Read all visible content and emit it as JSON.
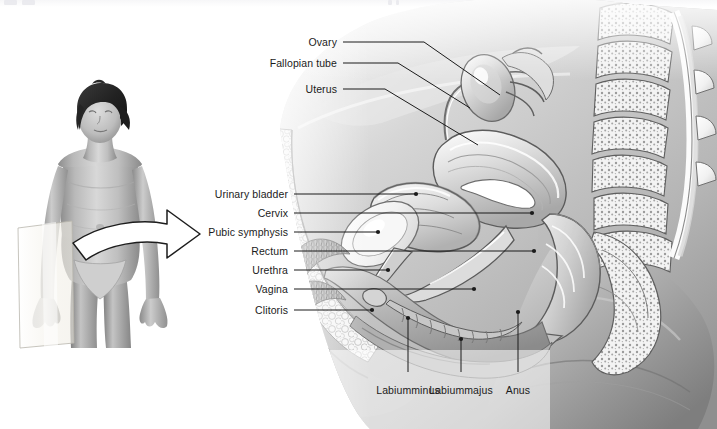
{
  "figure": {
    "orientation_photo_alt": "Standing female figure with midsagittal plane and curved arrow",
    "background_color": "#ffffff",
    "ink_color": "#1b1b1b"
  },
  "labels_left_upper": [
    {
      "id": "ovary",
      "text": "Ovary",
      "x": 337,
      "y": 42
    },
    {
      "id": "fallopian-tube",
      "text": "Fallopian tube",
      "x": 337,
      "y": 63
    },
    {
      "id": "uterus",
      "text": "Uterus",
      "x": 337,
      "y": 89
    }
  ],
  "labels_left_lower": [
    {
      "id": "urinary-bladder",
      "text": "Urinary bladder",
      "x": 288,
      "y": 194
    },
    {
      "id": "cervix",
      "text": "Cervix",
      "x": 288,
      "y": 213
    },
    {
      "id": "pubic-symphysis",
      "text": "Pubic symphysis",
      "x": 288,
      "y": 232
    },
    {
      "id": "rectum",
      "text": "Rectum",
      "x": 288,
      "y": 251
    },
    {
      "id": "urethra",
      "text": "Urethra",
      "x": 288,
      "y": 270
    },
    {
      "id": "vagina",
      "text": "Vagina",
      "x": 288,
      "y": 289
    },
    {
      "id": "clitoris",
      "text": "Clitoris",
      "x": 288,
      "y": 310
    }
  ],
  "labels_bottom": [
    {
      "id": "labium-minus",
      "line1": "Labium",
      "line2": "minus",
      "x": 408,
      "y": 390
    },
    {
      "id": "labium-majus",
      "line1": "Labium",
      "line2": "majus",
      "x": 461,
      "y": 390
    },
    {
      "id": "anus",
      "line1": "Anus",
      "line2": "",
      "x": 518,
      "y": 390
    }
  ],
  "leaders_upper": [
    {
      "id": "ovary",
      "path": "M343,42 L424,42 L500,95"
    },
    {
      "id": "fallopian-tube",
      "path": "M343,63 L398,63 L470,108"
    },
    {
      "id": "uterus",
      "path": "M343,89 L385,89 L478,145"
    }
  ],
  "leaders_lower": [
    {
      "id": "urinary-bladder",
      "path": "M294,194 L416,194",
      "dot": [
        416,
        194
      ]
    },
    {
      "id": "cervix",
      "path": "M294,213 L532,213",
      "dot": [
        532,
        213
      ]
    },
    {
      "id": "pubic-symphysis",
      "path": "M294,232 L378,232",
      "dot": [
        378,
        232
      ]
    },
    {
      "id": "rectum",
      "path": "M294,251 L534,251",
      "dot": [
        534,
        251
      ]
    },
    {
      "id": "urethra",
      "path": "M294,270 L388,270",
      "dot": [
        388,
        270
      ]
    },
    {
      "id": "vagina",
      "path": "M294,289 L474,289",
      "dot": [
        474,
        289
      ]
    },
    {
      "id": "clitoris",
      "path": "M294,310 L372,310",
      "dot": [
        372,
        310
      ]
    }
  ],
  "leaders_bottom": [
    {
      "id": "labium-minus",
      "path": "M408,372 L408,318",
      "dot": [
        408,
        318
      ]
    },
    {
      "id": "labium-majus",
      "path": "M461,372 L461,339",
      "dot": [
        461,
        339
      ]
    },
    {
      "id": "anus",
      "path": "M518,372 L518,312",
      "dot": [
        518,
        312
      ]
    }
  ],
  "orientation_photo": {
    "plane_label": "midsagittal-plane",
    "arrow_label": "section-direction-arrow"
  }
}
